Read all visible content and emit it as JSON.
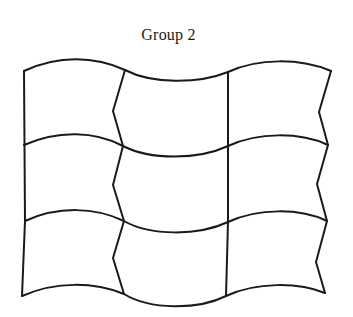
{
  "figure": {
    "title": "Group 2",
    "stroke_color": "#1a1a1a",
    "background": "#ffffff",
    "grid": {
      "rows": 3,
      "columns": 3,
      "horizontal_lines": [
        "M24,71 C58,55 95,56 125,70 C152,84 198,84 228,72 C258,58 300,58 331,71",
        "M24,145 C58,130 95,131 123,146 C150,160 198,160 228,146 C258,132 300,132 328,145",
        "M25,221 C58,206 95,207 124,221 C150,236 198,236 228,222 C258,208 300,208 327,221",
        "M22,296 C56,281 94,282 124,294 C150,310 198,310 226,296 C256,282 298,282 325,293"
      ],
      "vertical_lines": [
        "M24,71 L25,221 L22,296",
        "M125,70 L113,111 L123,146 L113,185 L124,221 L113,258 L124,294",
        "M228,72 L228,146 L228,222 L226,296",
        "M331,71 L319,112 L328,145 L317,184 L327,221 L316,262 L325,293"
      ]
    }
  }
}
